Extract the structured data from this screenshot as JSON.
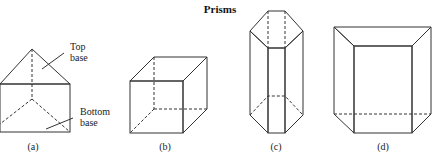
{
  "title": "Prisms",
  "figures": [
    {
      "id": "a",
      "caption": "(a)",
      "shape": "triangular-prism",
      "annotations": [
        {
          "line1": "Top",
          "line2": "base"
        },
        {
          "line1": "Bottom",
          "line2": "base"
        }
      ]
    },
    {
      "id": "b",
      "caption": "(b)",
      "shape": "cube"
    },
    {
      "id": "c",
      "caption": "(c)",
      "shape": "hexagonal-prism"
    },
    {
      "id": "d",
      "caption": "(d)",
      "shape": "trapezoidal-prism"
    }
  ],
  "colors": {
    "edge": "#333333",
    "shade_light": "#e6e6e6",
    "shade_mid": "#bdbdbd",
    "shade_dark": "#8a8a8a"
  }
}
